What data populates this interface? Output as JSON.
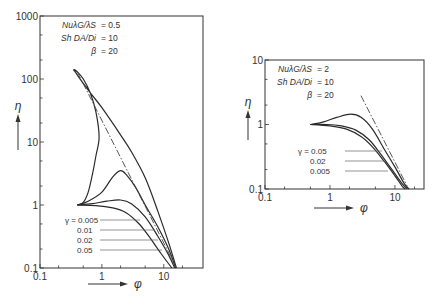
{
  "chart_data": [
    {
      "type": "line",
      "title": "",
      "xlabel": "φ",
      "ylabel": "η",
      "xscale": "log",
      "yscale": "log",
      "xlim": [
        0.1,
        43
      ],
      "ylim": [
        0.1,
        1000
      ],
      "x_tick_labels": [
        "0.1",
        "1",
        "10"
      ],
      "y_tick_labels": [
        "0.1",
        "1",
        "10",
        "100",
        "1000"
      ],
      "grid": false,
      "parameters": [
        {
          "name": "Nu λG / λS",
          "value": "0.5"
        },
        {
          "name": "Sh DA / Di",
          "value": "10"
        },
        {
          "name": "β",
          "value": "20"
        }
      ],
      "legend_title": "γ",
      "series": [
        {
          "name": "γ = 0.005",
          "points": [
            [
              0.4,
              1.0
            ],
            [
              0.5,
              1.1
            ],
            [
              0.6,
              1.6
            ],
            [
              0.7,
              3.0
            ],
            [
              0.8,
              6
            ],
            [
              0.9,
              12
            ],
            [
              0.8,
              30
            ],
            [
              0.65,
              60
            ],
            [
              0.5,
              100
            ],
            [
              0.4,
              130
            ],
            [
              0.35,
              140
            ],
            [
              0.38,
              125
            ],
            [
              0.5,
              85
            ],
            [
              0.7,
              55
            ],
            [
              1,
              35
            ],
            [
              2,
              13
            ],
            [
              3,
              7
            ],
            [
              5,
              2.7
            ],
            [
              8,
              0.8
            ],
            [
              12,
              0.25
            ],
            [
              16,
              0.1
            ]
          ]
        },
        {
          "name": "γ = 0.01",
          "points": [
            [
              0.4,
              1.0
            ],
            [
              0.6,
              1.15
            ],
            [
              1.0,
              1.6
            ],
            [
              1.5,
              2.8
            ],
            [
              2.0,
              3.5
            ],
            [
              2.5,
              3.0
            ],
            [
              3.5,
              1.9
            ],
            [
              5,
              1.0
            ],
            [
              8,
              0.45
            ],
            [
              12,
              0.2
            ],
            [
              15.5,
              0.1
            ]
          ]
        },
        {
          "name": "γ = 0.02",
          "points": [
            [
              0.4,
              1.0
            ],
            [
              0.7,
              1.05
            ],
            [
              1.2,
              1.15
            ],
            [
              2.0,
              1.2
            ],
            [
              3.0,
              1.05
            ],
            [
              5,
              0.65
            ],
            [
              8,
              0.32
            ],
            [
              12,
              0.16
            ],
            [
              15,
              0.1
            ]
          ]
        },
        {
          "name": "γ = 0.05",
          "points": [
            [
              0.4,
              1.0
            ],
            [
              0.8,
              0.98
            ],
            [
              1.5,
              0.9
            ],
            [
              2.5,
              0.75
            ],
            [
              4,
              0.5
            ],
            [
              6,
              0.3
            ],
            [
              9,
              0.17
            ],
            [
              13.5,
              0.1
            ]
          ]
        }
      ],
      "asymptote": {
        "style": "dash-dot",
        "points": [
          [
            0.4,
            130
          ],
          [
            16,
            0.1
          ]
        ]
      },
      "gamma_labels": [
        "γ = 0.005",
        "0.01",
        "0.02",
        "0.05"
      ]
    },
    {
      "type": "line",
      "title": "",
      "xlabel": "φ",
      "ylabel": "η",
      "xscale": "log",
      "yscale": "log",
      "xlim": [
        0.1,
        28
      ],
      "ylim": [
        0.1,
        10
      ],
      "x_tick_labels": [
        "0.1",
        "1",
        "10"
      ],
      "y_tick_labels": [
        "0.1",
        "1",
        "10"
      ],
      "grid": false,
      "parameters": [
        {
          "name": "Nu λG / λS",
          "value": "2"
        },
        {
          "name": "Sh DA / Di",
          "value": "10"
        },
        {
          "name": "β",
          "value": "20"
        }
      ],
      "legend_title": "γ",
      "series": [
        {
          "name": "γ = 0.005",
          "points": [
            [
              0.5,
              1.0
            ],
            [
              0.8,
              1.1
            ],
            [
              1.3,
              1.3
            ],
            [
              2.1,
              1.45
            ],
            [
              3,
              1.3
            ],
            [
              4.5,
              0.85
            ],
            [
              7,
              0.4
            ],
            [
              10,
              0.22
            ],
            [
              14,
              0.12
            ],
            [
              16.5,
              0.1
            ]
          ]
        },
        {
          "name": "γ = 0.02",
          "points": [
            [
              0.5,
              1.0
            ],
            [
              0.9,
              1.0
            ],
            [
              1.5,
              0.95
            ],
            [
              2.5,
              0.82
            ],
            [
              4,
              0.58
            ],
            [
              6,
              0.35
            ],
            [
              9,
              0.2
            ],
            [
              13,
              0.12
            ],
            [
              15.5,
              0.1
            ]
          ]
        },
        {
          "name": "γ = 0.05",
          "points": [
            [
              0.5,
              1.0
            ],
            [
              1.0,
              0.95
            ],
            [
              1.8,
              0.85
            ],
            [
              3,
              0.65
            ],
            [
              4.5,
              0.45
            ],
            [
              7,
              0.26
            ],
            [
              10,
              0.16
            ],
            [
              13,
              0.11
            ],
            [
              14.5,
              0.1
            ]
          ]
        }
      ],
      "asymptote": {
        "style": "dash-dot",
        "points": [
          [
            3.0,
            2.8
          ],
          [
            15.5,
            0.11
          ]
        ]
      },
      "gamma_labels": [
        "γ = 0.05",
        "0.02",
        "0.005"
      ]
    }
  ],
  "left_chart": {
    "params": [
      {
        "name": "NuλG/λS",
        "value": "= 0.5"
      },
      {
        "name": "Sh DA/Di",
        "value": "= 10"
      },
      {
        "name": "β",
        "value": "= 20"
      }
    ],
    "gamma_labels": [
      "γ = 0.005",
      "0.01",
      "0.02",
      "0.05"
    ],
    "x_axis_label": "φ",
    "y_axis_label": "η"
  },
  "right_chart": {
    "params": [
      {
        "name": "NuλG/λS",
        "value": "= 2"
      },
      {
        "name": "Sh DA/Di",
        "value": "= 10"
      },
      {
        "name": "β",
        "value": "= 20"
      }
    ],
    "gamma_labels": [
      "γ = 0.05",
      "0.02",
      "0.005"
    ],
    "x_axis_label": "φ",
    "y_axis_label": "η"
  }
}
